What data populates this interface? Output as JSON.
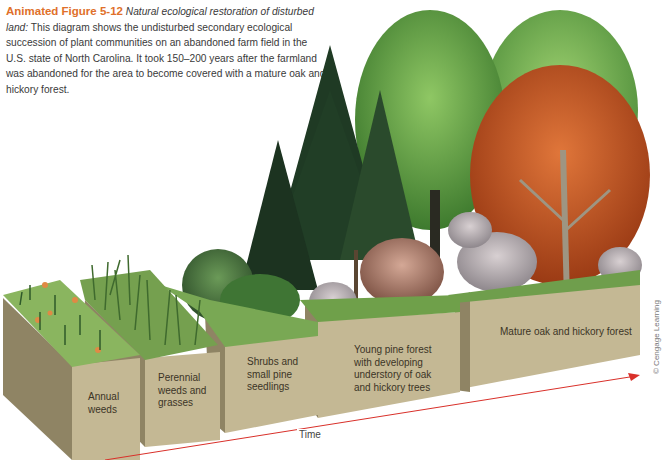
{
  "caption": {
    "figure_label": "Animated Figure 5-12",
    "title_italic": "Natural ecological restoration of disturbed land:",
    "body": "This diagram shows the undisturbed secondary ecological succession of plant communities on an abandoned farm field in the U.S. state of North Carolina. It took 150–200 years after the farmland was abandoned for the area to become covered with a mature oak and hickory forest."
  },
  "stages": [
    {
      "label": "Annual weeds"
    },
    {
      "label": "Perennial weeds and grasses"
    },
    {
      "label": "Shrubs and small pine seedlings"
    },
    {
      "label": "Young pine forest with developing understory of oak and hickory trees"
    },
    {
      "label": "Mature oak and hickory forest"
    }
  ],
  "axis": {
    "label": "Time",
    "arrow_color": "#d9302a"
  },
  "copyright": "© Cengage Learning",
  "colors": {
    "soil_front": "#c4b894",
    "soil_side": "#8f8464",
    "grass": "#7fa653",
    "pine": "#1f3a24",
    "oak_green": "#4e8d3a",
    "oak_light": "#7fba58",
    "hickory_autumn": "#c2511f",
    "accent": "#e0702a"
  }
}
